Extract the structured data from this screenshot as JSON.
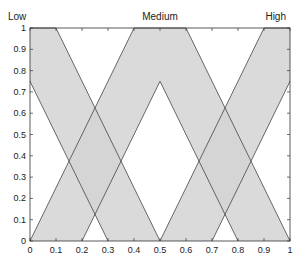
{
  "chart_data": {
    "type": "area",
    "title": "",
    "xlabel": "",
    "ylabel": "",
    "xlim": [
      0,
      1
    ],
    "ylim": [
      0,
      1
    ],
    "grid": false,
    "fill_color": "#d3d3d3",
    "edge_color": "#444444",
    "x_ticks": [
      "0",
      "0.1",
      "0.2",
      "0.3",
      "0.4",
      "0.5",
      "0.6",
      "0.7",
      "0.8",
      "0.9",
      "1"
    ],
    "y_ticks": [
      "0",
      "0.1",
      "0.2",
      "0.3",
      "0.4",
      "0.5",
      "0.6",
      "0.7",
      "0.8",
      "0.9",
      "1"
    ],
    "series": [
      {
        "name": "Low",
        "label_x": 0.0,
        "upper": [
          [
            0,
            1
          ],
          [
            0.1,
            1
          ],
          [
            0.5,
            0
          ]
        ],
        "lower": [
          [
            0,
            0.75
          ],
          [
            0.3,
            0
          ]
        ]
      },
      {
        "name": "Medium",
        "label_x": 0.5,
        "upper": [
          [
            0,
            0
          ],
          [
            0.4,
            1
          ],
          [
            0.6,
            1
          ],
          [
            1,
            0
          ]
        ],
        "lower": [
          [
            0.2,
            0
          ],
          [
            0.5,
            0.75
          ],
          [
            0.8,
            0
          ]
        ]
      },
      {
        "name": "High",
        "label_x": 1.0,
        "upper": [
          [
            0.5,
            0
          ],
          [
            0.9,
            1
          ],
          [
            1,
            1
          ]
        ],
        "lower": [
          [
            0.7,
            0
          ],
          [
            1,
            0.75
          ]
        ]
      }
    ]
  }
}
